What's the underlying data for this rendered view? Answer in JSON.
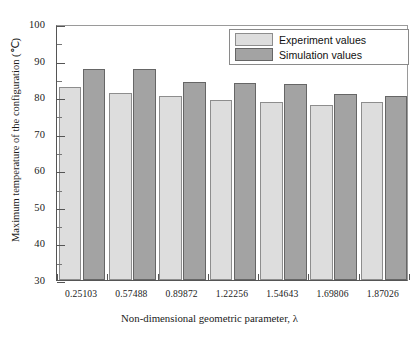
{
  "chart_data": {
    "type": "bar",
    "title": "",
    "xlabel": "Non-dimensional geometric parameter, λ",
    "ylabel": "Maximum temperature of the configuration (℃)",
    "categories": [
      "0.25103",
      "0.57488",
      "0.89872",
      "1.22256",
      "1.54643",
      "1.69806",
      "1.87026"
    ],
    "series": [
      {
        "name": "Experiment values",
        "color": "#dddddd",
        "values": [
          82.8,
          81.2,
          80.2,
          79.3,
          78.6,
          77.9,
          78.7
        ]
      },
      {
        "name": "Simulation values",
        "color": "#a3a3a3",
        "values": [
          87.7,
          87.7,
          84.2,
          84.0,
          83.7,
          80.8,
          80.2
        ]
      }
    ],
    "ylim": [
      30,
      100
    ],
    "ytick_step": 10,
    "yticks": [
      "30",
      "40",
      "50",
      "60",
      "70",
      "80",
      "90",
      "100"
    ],
    "yminor_step": 5,
    "grid": false,
    "legend_position": "top-right",
    "axis_color": "#555555"
  },
  "legend": {
    "entries": [
      {
        "label": "Experiment values",
        "swatch": "exp"
      },
      {
        "label": "Simulation values",
        "swatch": "sim"
      }
    ]
  }
}
